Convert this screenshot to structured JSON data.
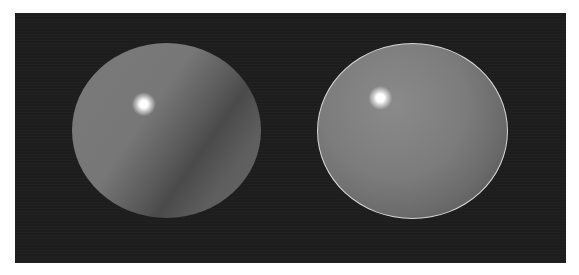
{
  "scene": {
    "background_color": "#1e1e1e",
    "frame_color": "#ffffff",
    "spheres": [
      {
        "name": "left-sphere",
        "shading": "flat with hard shadow terminator",
        "base_color": "#777777",
        "highlight_color": "#ffffff",
        "rim": false
      },
      {
        "name": "right-sphere",
        "shading": "smooth with bright rim",
        "base_color": "#7c7c7c",
        "highlight_color": "#ffffff",
        "rim": true,
        "rim_color": "#d8d8d8"
      }
    ]
  }
}
